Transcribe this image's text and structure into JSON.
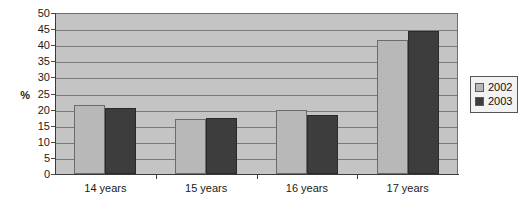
{
  "chart_data": {
    "type": "bar",
    "title": "",
    "subtitle": "",
    "xlabel": "",
    "ylabel": "%",
    "categories": [
      "14 years",
      "15 years",
      "16 years",
      "17 years"
    ],
    "series": [
      {
        "name": "2002",
        "color": "#b8b8b8",
        "values": [
          21.5,
          17.0,
          20.0,
          41.5
        ]
      },
      {
        "name": "2003",
        "color": "#3d3d3d",
        "values": [
          20.5,
          17.3,
          18.2,
          44.5
        ]
      }
    ],
    "ylim": [
      0,
      50
    ],
    "ytick_step": 5,
    "yticks": [
      0,
      5,
      10,
      15,
      20,
      25,
      30,
      35,
      40,
      45,
      50
    ],
    "ytick_labels": [
      "0",
      "5",
      "10",
      "15",
      "20",
      "25",
      "30",
      "35",
      "40",
      "45",
      "50"
    ],
    "grid": true,
    "grid_axis": "y",
    "legend_position": "right",
    "plot_background": "#c4c4c4",
    "gridline_color": "#7a7a7a",
    "axis_color": "#3a3a3a",
    "page_background": "#ffffff"
  },
  "legend": {
    "entries": [
      {
        "label": "2002",
        "color": "#b8b8b8"
      },
      {
        "label": "2003",
        "color": "#3d3d3d"
      }
    ]
  }
}
